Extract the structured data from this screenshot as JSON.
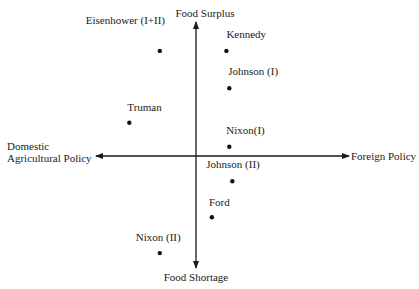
{
  "chart_data": {
    "type": "scatter",
    "title": "",
    "axes": {
      "x_negative_label": [
        "Domestic",
        "Agricultural Policy"
      ],
      "x_positive_label": "Foreign Policy",
      "y_positive_label": "Food Surplus",
      "y_negative_label": "Food Shortage"
    },
    "xlim": [
      -10,
      10
    ],
    "ylim": [
      -10,
      10
    ],
    "grid": false,
    "legend": "none",
    "points": [
      {
        "label": "Eisenhower (I+II)",
        "x": -2.5,
        "y": 7.9
      },
      {
        "label": "Kennedy",
        "x": 2.1,
        "y": 7.9
      },
      {
        "label": "Johnson (I)",
        "x": 2.3,
        "y": 5.1
      },
      {
        "label": "Truman",
        "x": -4.6,
        "y": 2.5
      },
      {
        "label": "Nixon(I)",
        "x": 2.3,
        "y": 0.7
      },
      {
        "label": "Johnson (II)",
        "x": 2.5,
        "y": -1.9
      },
      {
        "label": "Ford",
        "x": 1.1,
        "y": -4.6
      },
      {
        "label": "Nixon (II)",
        "x": -2.5,
        "y": -7.3
      }
    ]
  }
}
